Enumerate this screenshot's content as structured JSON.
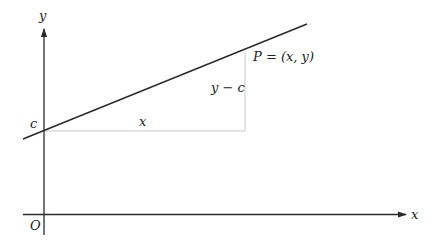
{
  "diagram": {
    "type": "coordinate-geometry",
    "colors": {
      "axis": "#2a2a2a",
      "line": "#2a2a2a",
      "guide": "#c8c8c8",
      "text": "#222222"
    },
    "axes": {
      "x_label": "x",
      "y_label": "y",
      "origin_label": "O"
    },
    "line": {
      "intercept_label": "c",
      "start": [
        23,
        139
      ],
      "end": [
        307,
        24
      ]
    },
    "point": {
      "label": "P = (x, y)"
    },
    "triangle": {
      "run_label": "x",
      "rise_label": "y − c"
    }
  }
}
